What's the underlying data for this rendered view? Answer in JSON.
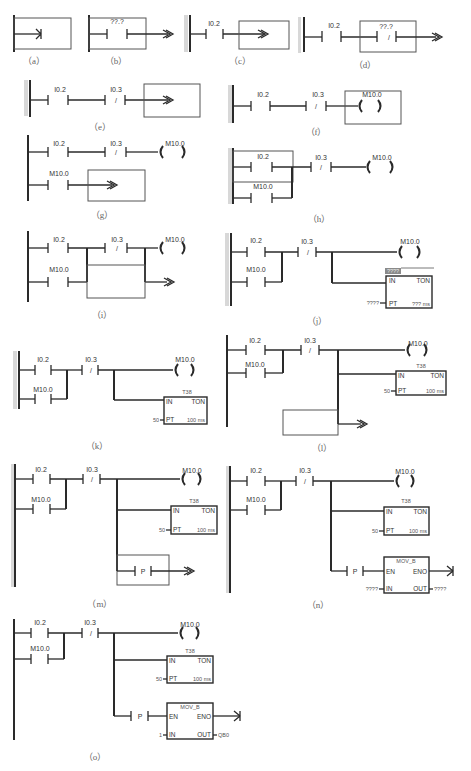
{
  "figure": {
    "panels": [
      {
        "id": "a",
        "caption": "（a）"
      },
      {
        "id": "b",
        "caption": "（b）",
        "contact_label": "??.?"
      },
      {
        "id": "c",
        "caption": "（c）",
        "contact_label": "I0.2"
      },
      {
        "id": "d",
        "caption": "（d）",
        "contact1_label": "I0.2",
        "contact2_label": "??.?",
        "contact2_type": "/"
      },
      {
        "id": "e",
        "caption": "（e）",
        "contact1_label": "I0.2",
        "contact2_label": "I0.3",
        "contact2_type": "/"
      },
      {
        "id": "f",
        "caption": "（f）",
        "contact1_label": "I0.2",
        "contact2_label": "I0.3",
        "contact2_type": "/",
        "coil_label": "M10.0"
      },
      {
        "id": "g",
        "caption": "（g）",
        "contact1_label": "I0.2",
        "contact2_label": "I0.3",
        "contact2_type": "/",
        "coil_label": "M10.0",
        "contact3_label": "M10.0"
      },
      {
        "id": "h",
        "caption": "（h）",
        "contact1_label": "I0.2",
        "contact2_label": "I0.3",
        "contact2_type": "/",
        "coil_label": "M10.0",
        "contact3_label": "M10.0"
      },
      {
        "id": "i",
        "caption": "（i）",
        "contact1_label": "I0.2",
        "contact2_label": "I0.3",
        "contact2_type": "/",
        "coil_label": "M10.0",
        "contact3_label": "M10.0"
      },
      {
        "id": "j",
        "caption": "（j）",
        "contact1_label": "I0.2",
        "contact2_label": "I0.3",
        "contact2_type": "/",
        "coil_label": "M10.0",
        "contact3_label": "M10.0",
        "timer": {
          "name": "????",
          "in": "IN",
          "type": "TON",
          "pt": "PT",
          "pt_value": "????",
          "base": "??? ms"
        }
      },
      {
        "id": "k",
        "caption": "（k）",
        "contact1_label": "I0.2",
        "contact2_label": "I0.3",
        "contact2_type": "/",
        "coil_label": "M10.0",
        "contact3_label": "M10.0",
        "timer": {
          "name": "T38",
          "in": "IN",
          "type": "TON",
          "pt": "PT",
          "pt_value": "50",
          "base": "100 ms"
        }
      },
      {
        "id": "l",
        "caption": "（l）",
        "contact1_label": "I0.2",
        "contact2_label": "I0.3",
        "contact2_type": "/",
        "coil_label": "M10.0",
        "contact3_label": "M10.0",
        "timer": {
          "name": "T38",
          "in": "IN",
          "type": "TON",
          "pt": "PT",
          "pt_value": "50",
          "base": "100 ms"
        }
      },
      {
        "id": "m",
        "caption": "（m）",
        "contact1_label": "I0.2",
        "contact2_label": "I0.3",
        "contact2_type": "/",
        "coil_label": "M10.0",
        "contact3_label": "M10.0",
        "timer": {
          "name": "T38",
          "in": "IN",
          "type": "TON",
          "pt": "PT",
          "pt_value": "50",
          "base": "100 ms"
        },
        "edge_label": "P"
      },
      {
        "id": "n",
        "caption": "（n）",
        "contact1_label": "I0.2",
        "contact2_label": "I0.3",
        "contact2_type": "/",
        "coil_label": "M10.0",
        "contact3_label": "M10.0",
        "timer": {
          "name": "T38",
          "in": "IN",
          "type": "TON",
          "pt": "PT",
          "pt_value": "50",
          "base": "100 ms"
        },
        "edge_label": "P",
        "move": {
          "name": "MOV_B",
          "en": "EN",
          "eno": "ENO",
          "in": "IN",
          "out": "OUT",
          "in_value": "????",
          "out_value": "????"
        }
      },
      {
        "id": "o",
        "caption": "（o）",
        "contact1_label": "I0.2",
        "contact2_label": "I0.3",
        "contact2_type": "/",
        "coil_label": "M10.0",
        "contact3_label": "M10.0",
        "timer": {
          "name": "T38",
          "in": "IN",
          "type": "TON",
          "pt": "PT",
          "pt_value": "50",
          "base": "100 ms"
        },
        "edge_label": "P",
        "move": {
          "name": "MOV_B",
          "en": "EN",
          "eno": "ENO",
          "in": "IN",
          "out": "OUT",
          "in_value": "1",
          "out_value": "QB0"
        }
      }
    ]
  }
}
